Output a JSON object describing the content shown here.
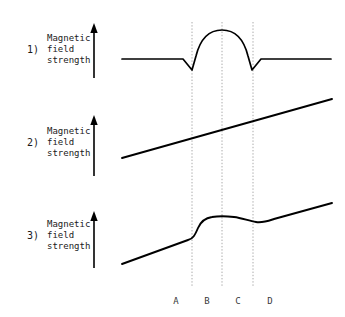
{
  "figure": {
    "width": 345,
    "height": 317,
    "background_color": "#ffffff",
    "line_color": "#000000",
    "guide_color": "#aaaaaa",
    "text_color": "#1a1a1a"
  },
  "rows": [
    {
      "index_label": "1)",
      "axis_label_line1": "Magnetic",
      "axis_label_line2": "field",
      "axis_label_line3": "strength",
      "arrow_name": "up-arrow-icon"
    },
    {
      "index_label": "2)",
      "axis_label_line1": "Magnetic",
      "axis_label_line2": "field",
      "axis_label_line3": "strength",
      "arrow_name": "up-arrow-icon"
    },
    {
      "index_label": "3)",
      "axis_label_line1": "Magnetic",
      "axis_label_line2": "field",
      "axis_label_line3": "strength",
      "arrow_name": "up-arrow-icon"
    }
  ],
  "x_axis": {
    "tick_labels": [
      "A",
      "B",
      "C",
      "D"
    ],
    "tick_x_positions": [
      176,
      207,
      238,
      270
    ],
    "label_y": 296
  },
  "guide_lines": {
    "x_positions": [
      192,
      222,
      253
    ],
    "y_top": 22,
    "y_bottom": 286,
    "style": "dotted"
  },
  "chart_data": {
    "type": "line",
    "title": "",
    "xlabel": "",
    "ylabel": "Magnetic field strength",
    "grid": "vertical dotted guides at B, C, D",
    "legend": "none",
    "panels": [
      {
        "name": "panel-1",
        "index_label": "1)",
        "description": "Flat baseline with sharp downward spikes at guide 1 and guide 3, and a smooth semicircular dome peaking between them",
        "path": "M 122 59 L 183 59 L 192 70 L 196 56 C 201 36 212 30 222 30 C 232 30 243 36 248 56 L 252 70 L 261 59 L 331 59",
        "baseline_y": 59,
        "peak_y": 30,
        "spike_y": 70
      },
      {
        "name": "panel-2",
        "index_label": "2)",
        "description": "Straight line rising steadily from left to right across the full width",
        "path": "M 122 158 L 332 99",
        "start_point": [
          122,
          158
        ],
        "end_point": [
          332,
          99
        ]
      },
      {
        "name": "panel-3",
        "index_label": "3)",
        "description": "Gentle rise, steep step up at guide 1, plateau through guide 2, shallow dip before guide 3, then gentle rise again",
        "path": "M 122 264 L 188 240 C 193 239 195 235 198 228 C 201 221 205 218 212 217 C 218 216 226 216 234 217 C 242 218 249 221 256 222 C 263 223 268 221 274 219 L 332 203",
        "start_point": [
          122,
          264
        ],
        "plateau_y": 217,
        "end_point": [
          332,
          203
        ]
      }
    ]
  }
}
